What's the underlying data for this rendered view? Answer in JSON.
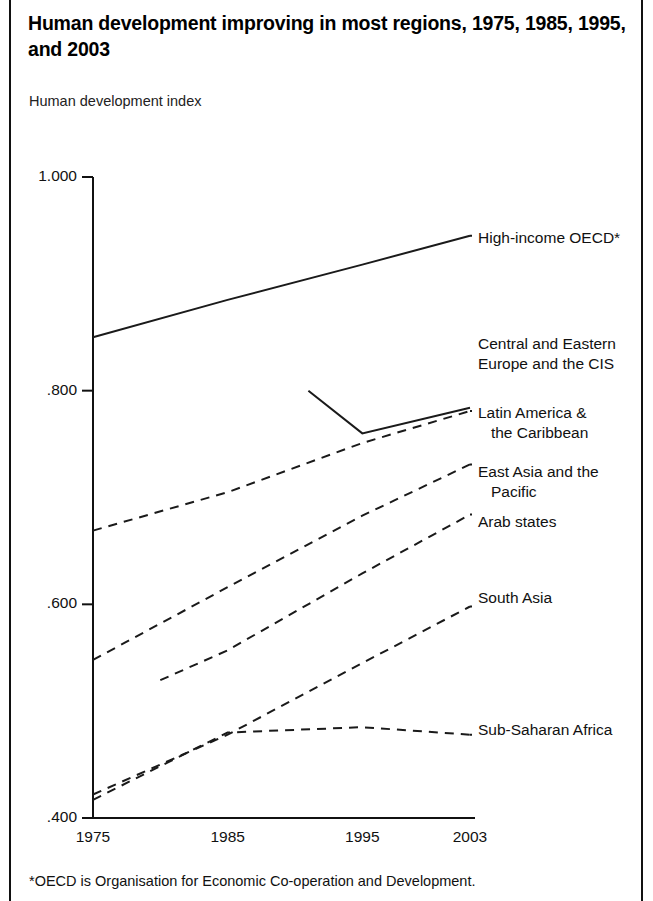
{
  "figure": {
    "title": "Human development improving in most regions, 1975, 1985, 1995, and 2003",
    "subtitle": "Human development index",
    "footnote": "*OECD is Organisation for Economic Co-operation and Development."
  },
  "chart_data": {
    "type": "line",
    "title": "Human development improving in most regions, 1975, 1985, 1995, and 2003",
    "subtitle": "Human development index",
    "xlabel": "",
    "ylabel": "Human development index",
    "x": [
      1975,
      1985,
      1995,
      2003
    ],
    "xtick_labels": [
      "1975",
      "1985",
      "1995",
      "2003"
    ],
    "ytick_labels": [
      "1.000",
      ".800",
      ".600",
      ".400"
    ],
    "ytick_values": [
      1.0,
      0.8,
      0.6,
      0.4
    ],
    "ylim": [
      0.4,
      1.0
    ],
    "xlim": [
      1975,
      2003
    ],
    "grid": false,
    "legend_position": "right-inline-labels",
    "series": [
      {
        "name": "High-income OECD*",
        "label_lines": [
          "High-income OECD*"
        ],
        "style": "solid",
        "x": [
          1975,
          1985,
          1995,
          2003
        ],
        "values": [
          0.85,
          0.885,
          0.918,
          0.945
        ]
      },
      {
        "name": "Central and Eastern Europe and the CIS",
        "label_lines": [
          "Central and Eastern",
          "Europe and the CIS"
        ],
        "style": "solid",
        "x": [
          1991,
          1995,
          2003
        ],
        "values": [
          0.8,
          0.76,
          0.784
        ]
      },
      {
        "name": "Latin America & the Caribbean",
        "label_lines": [
          "Latin America &",
          "   the Caribbean"
        ],
        "style": "dashed",
        "x": [
          1975,
          1985,
          1995,
          2003
        ],
        "values": [
          0.669,
          0.705,
          0.751,
          0.781
        ]
      },
      {
        "name": "East Asia and the Pacific",
        "label_lines": [
          "East Asia and the",
          "   Pacific"
        ],
        "style": "dashed",
        "x": [
          1975,
          1985,
          1995,
          2003
        ],
        "values": [
          0.548,
          0.616,
          0.683,
          0.731
        ]
      },
      {
        "name": "Arab states",
        "label_lines": [
          "Arab states"
        ],
        "style": "dashed",
        "x": [
          1980,
          1985,
          1995,
          2003
        ],
        "values": [
          0.529,
          0.557,
          0.629,
          0.684
        ]
      },
      {
        "name": "South Asia",
        "label_lines": [
          "South Asia"
        ],
        "style": "dashed",
        "x": [
          1975,
          1985,
          1995,
          2003
        ],
        "values": [
          0.422,
          0.478,
          0.545,
          0.598
        ]
      },
      {
        "name": "Sub-Saharan Africa",
        "label_lines": [
          "Sub-Saharan Africa"
        ],
        "style": "dashed",
        "x": [
          1975,
          1985,
          1995,
          2003
        ],
        "values": [
          0.417,
          0.48,
          0.485,
          0.478
        ]
      }
    ],
    "colors": {
      "line": "#1a1a1a",
      "axis": "#111111",
      "background": "#ffffff"
    }
  },
  "axis_labels": {
    "y": [
      {
        "text": "1.000",
        "value": 1.0
      },
      {
        "text": ".800",
        "value": 0.8
      },
      {
        "text": ".600",
        "value": 0.6
      },
      {
        "text": ".400",
        "value": 0.4
      }
    ],
    "x": [
      {
        "text": "1975",
        "value": 1975
      },
      {
        "text": "1985",
        "value": 1985
      },
      {
        "text": "1995",
        "value": 1995
      },
      {
        "text": "2003",
        "value": 2003
      }
    ]
  },
  "series_labels": [
    {
      "name": "High-income OECD*",
      "lines": [
        "High-income OECD*"
      ]
    },
    {
      "name": "Central and Eastern Europe and the CIS",
      "lines": [
        "Central and Eastern",
        "Europe and the CIS"
      ]
    },
    {
      "name": "Latin America & the Caribbean",
      "lines": [
        "Latin America &",
        "   the Caribbean"
      ]
    },
    {
      "name": "East Asia and the Pacific",
      "lines": [
        "East Asia and the",
        "   Pacific"
      ]
    },
    {
      "name": "Arab states",
      "lines": [
        "Arab states"
      ]
    },
    {
      "name": "South Asia",
      "lines": [
        "South Asia"
      ]
    },
    {
      "name": "Sub-Saharan Africa",
      "lines": [
        "Sub-Saharan Africa"
      ]
    }
  ]
}
